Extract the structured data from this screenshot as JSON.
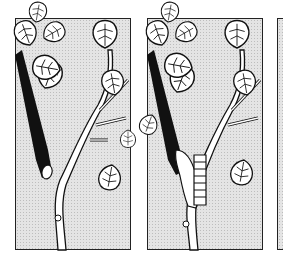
{
  "illustration": {
    "description": "Three-panel line-art sequence of a branch with heart-shaped leaves; in the second panel a segmented caterpillar climbs the stem beside a dark stick",
    "panels": [
      {
        "id": 1,
        "content": "Dark stick and leafy branch, no caterpillar"
      },
      {
        "id": 2,
        "content": "Dark stick, leafy branch, caterpillar climbing at the fork"
      },
      {
        "id": 3,
        "content": "Partially visible panel edge"
      }
    ],
    "colors": {
      "line": "#111111",
      "stick": "#111111",
      "screen": "#e4e4e4",
      "leaf_fill": "#ffffff",
      "background": "#ffffff"
    }
  }
}
